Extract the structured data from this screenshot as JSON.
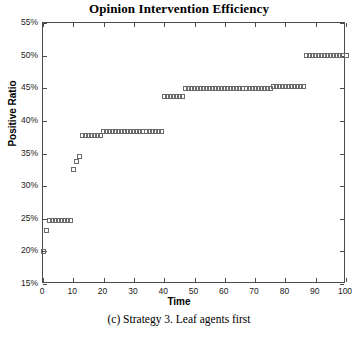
{
  "chart_data": {
    "type": "scatter",
    "title": "Opinion Intervention Efficiency",
    "xlabel": "Time",
    "ylabel": "Positive Ratio",
    "caption": "(c) Strategy 3. Leaf agents first",
    "grid": false,
    "legend": null,
    "marker": "open-square",
    "marker_color": "#6b6b6b",
    "xlim": [
      0,
      100
    ],
    "ylim": [
      15,
      55
    ],
    "xticks": [
      0,
      10,
      20,
      30,
      40,
      50,
      60,
      70,
      80,
      90,
      100
    ],
    "xtick_labels": [
      "0",
      "10",
      "20",
      "30",
      "40",
      "50",
      "60",
      "70",
      "80",
      "90",
      "100"
    ],
    "yticks": [
      15,
      20,
      25,
      30,
      35,
      40,
      45,
      50,
      55
    ],
    "ytick_labels": [
      "15%",
      "20%",
      "25%",
      "30%",
      "35%",
      "40%",
      "45%",
      "50%",
      "55%"
    ],
    "x": [
      0,
      1,
      2,
      3,
      4,
      5,
      6,
      7,
      8,
      9,
      10,
      11,
      12,
      13,
      14,
      15,
      16,
      17,
      18,
      19,
      20,
      21,
      22,
      23,
      24,
      25,
      26,
      27,
      28,
      29,
      30,
      31,
      32,
      33,
      34,
      35,
      36,
      37,
      38,
      39,
      40,
      41,
      42,
      43,
      44,
      45,
      46,
      47,
      48,
      49,
      50,
      51,
      52,
      53,
      54,
      55,
      56,
      57,
      58,
      59,
      60,
      61,
      62,
      63,
      64,
      65,
      66,
      67,
      68,
      69,
      70,
      71,
      72,
      73,
      74,
      75,
      76,
      77,
      78,
      79,
      80,
      81,
      82,
      83,
      84,
      85,
      86,
      87,
      88,
      89,
      90,
      91,
      92,
      93,
      94,
      95,
      96,
      97,
      98,
      99,
      100
    ],
    "y": [
      20.0,
      23.2,
      24.8,
      24.8,
      24.8,
      24.8,
      24.8,
      24.8,
      24.8,
      24.8,
      32.6,
      33.8,
      34.6,
      37.8,
      37.8,
      37.8,
      37.8,
      37.8,
      37.8,
      37.8,
      38.4,
      38.4,
      38.4,
      38.4,
      38.4,
      38.4,
      38.4,
      38.4,
      38.4,
      38.4,
      38.4,
      38.4,
      38.4,
      38.4,
      38.4,
      38.4,
      38.4,
      38.4,
      38.4,
      38.4,
      43.8,
      43.8,
      43.8,
      43.8,
      43.8,
      43.8,
      43.8,
      45.0,
      45.0,
      45.0,
      45.0,
      45.0,
      45.0,
      45.0,
      45.0,
      45.0,
      45.0,
      45.0,
      45.0,
      45.0,
      45.0,
      45.0,
      45.0,
      45.0,
      45.0,
      45.0,
      45.0,
      45.0,
      45.0,
      45.0,
      45.0,
      45.0,
      45.0,
      45.0,
      45.0,
      45.0,
      45.2,
      45.2,
      45.2,
      45.2,
      45.2,
      45.2,
      45.2,
      45.2,
      45.2,
      45.2,
      45.2,
      50.0,
      50.0,
      50.0,
      50.0,
      50.0,
      50.0,
      50.0,
      50.0,
      50.0,
      50.0,
      50.0,
      50.0,
      50.0,
      50.0
    ]
  },
  "axes": {
    "title": "Opinion Intervention Efficiency",
    "x_title": "Time",
    "y_title": "Positive Ratio",
    "caption": "(c) Strategy 3. Leaf agents first"
  },
  "colors": {
    "axis": "#4c4c4c",
    "marker": "#6b6b6b",
    "text": "#000000"
  }
}
